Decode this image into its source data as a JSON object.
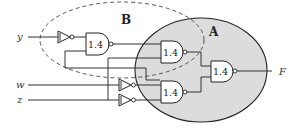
{
  "diagram": {
    "type": "logic-circuit",
    "inputs": [
      {
        "name": "y",
        "label": "y"
      },
      {
        "name": "w",
        "label": "w"
      },
      {
        "name": "z",
        "label": "z"
      }
    ],
    "output": {
      "name": "F",
      "label": "F"
    },
    "regions": {
      "A": {
        "label": "A",
        "style": "gray-filled-ellipse",
        "fill": "#dcdcdc"
      },
      "B": {
        "label": "B",
        "style": "dashed-ellipse"
      }
    },
    "gates": [
      {
        "id": "inv_y",
        "type": "NOT",
        "input": "y"
      },
      {
        "id": "nand_b",
        "type": "NAND",
        "label": "1.4",
        "region": "B"
      },
      {
        "id": "nand_a_top",
        "type": "NAND",
        "label": "1.4",
        "region": "A"
      },
      {
        "id": "nand_a_bottom",
        "type": "NAND",
        "label": "1.4",
        "region": "A"
      },
      {
        "id": "nand_out",
        "type": "NAND",
        "label": "1.4",
        "region": "A"
      },
      {
        "id": "inv_w",
        "type": "NOT",
        "input": "w"
      },
      {
        "id": "inv_z",
        "type": "NOT",
        "input": "z"
      }
    ],
    "colors": {
      "region_a_fill": "#dcdcdc",
      "line": "#222222"
    }
  }
}
